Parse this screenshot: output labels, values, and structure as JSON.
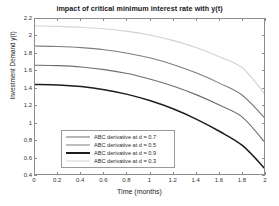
{
  "chart_data": {
    "type": "line",
    "title": "impact of critical minimum interest rate with y(t)",
    "xlabel": "Time (months)",
    "ylabel": "Investment Demand y(t)",
    "xlim": [
      0,
      2
    ],
    "ylim": [
      0.4,
      2.2
    ],
    "xticks": [
      "0",
      "0.2",
      "0.4",
      "0.6",
      "0.8",
      "1",
      "1.2",
      "1.4",
      "1.6",
      "1.8",
      "2"
    ],
    "xtick_values": [
      0,
      0.2,
      0.4,
      0.6,
      0.8,
      1,
      1.2,
      1.4,
      1.6,
      1.8,
      2
    ],
    "yticks": [
      "0.4",
      "0.6",
      "0.8",
      "1",
      "1.2",
      "1.4",
      "1.6",
      "1.8",
      "2",
      "2.2"
    ],
    "ytick_values": [
      0.4,
      0.6,
      0.8,
      1,
      1.2,
      1.4,
      1.6,
      1.8,
      2,
      2.2
    ],
    "grid": false,
    "legend_position": "lower-left-inside",
    "x": [
      0,
      0.2,
      0.4,
      0.6,
      0.8,
      1.0,
      1.2,
      1.4,
      1.6,
      1.8,
      2.0
    ],
    "series": [
      {
        "name": "ABC derivative  at d = 0.7",
        "d": 0.7,
        "color": "#6e6e6e",
        "width": 1.1,
        "values": [
          1.67,
          1.665,
          1.65,
          1.62,
          1.575,
          1.51,
          1.43,
          1.33,
          1.21,
          1.07,
          0.77
        ]
      },
      {
        "name": "ABC derivative  at d = 0.5",
        "d": 0.5,
        "color": "#7d7d7d",
        "width": 1.1,
        "values": [
          1.89,
          1.885,
          1.872,
          1.848,
          1.808,
          1.752,
          1.676,
          1.58,
          1.462,
          1.32,
          1.05
        ]
      },
      {
        "name": "ABC derivative  at d = 0.9",
        "d": 0.9,
        "color": "#1c1c1c",
        "width": 1.5,
        "values": [
          1.45,
          1.444,
          1.425,
          1.39,
          1.336,
          1.262,
          1.168,
          1.05,
          0.91,
          0.745,
          0.47
        ]
      },
      {
        "name": "ABC derivative  at d = 0.3",
        "d": 0.3,
        "color": "#d2d2d2",
        "width": 1.1,
        "values": [
          2.12,
          2.116,
          2.106,
          2.088,
          2.058,
          2.014,
          1.952,
          1.87,
          1.765,
          1.635,
          1.32
        ]
      }
    ]
  }
}
